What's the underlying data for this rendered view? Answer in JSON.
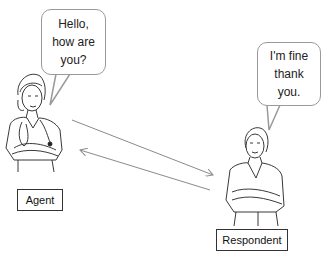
{
  "agent": {
    "speech_lines": [
      "Hello,",
      "how are",
      "you?"
    ],
    "label": "Agent"
  },
  "respondent": {
    "speech_lines": [
      "I'm fine",
      "thank",
      "you."
    ],
    "label": "Respondent"
  },
  "arrows": [
    {
      "from": "agent",
      "to": "respondent"
    },
    {
      "from": "respondent",
      "to": "agent"
    }
  ],
  "colors": {
    "line": "#8a8a8a",
    "bubble_border": "#9a9a9a",
    "box_border": "#333333"
  }
}
